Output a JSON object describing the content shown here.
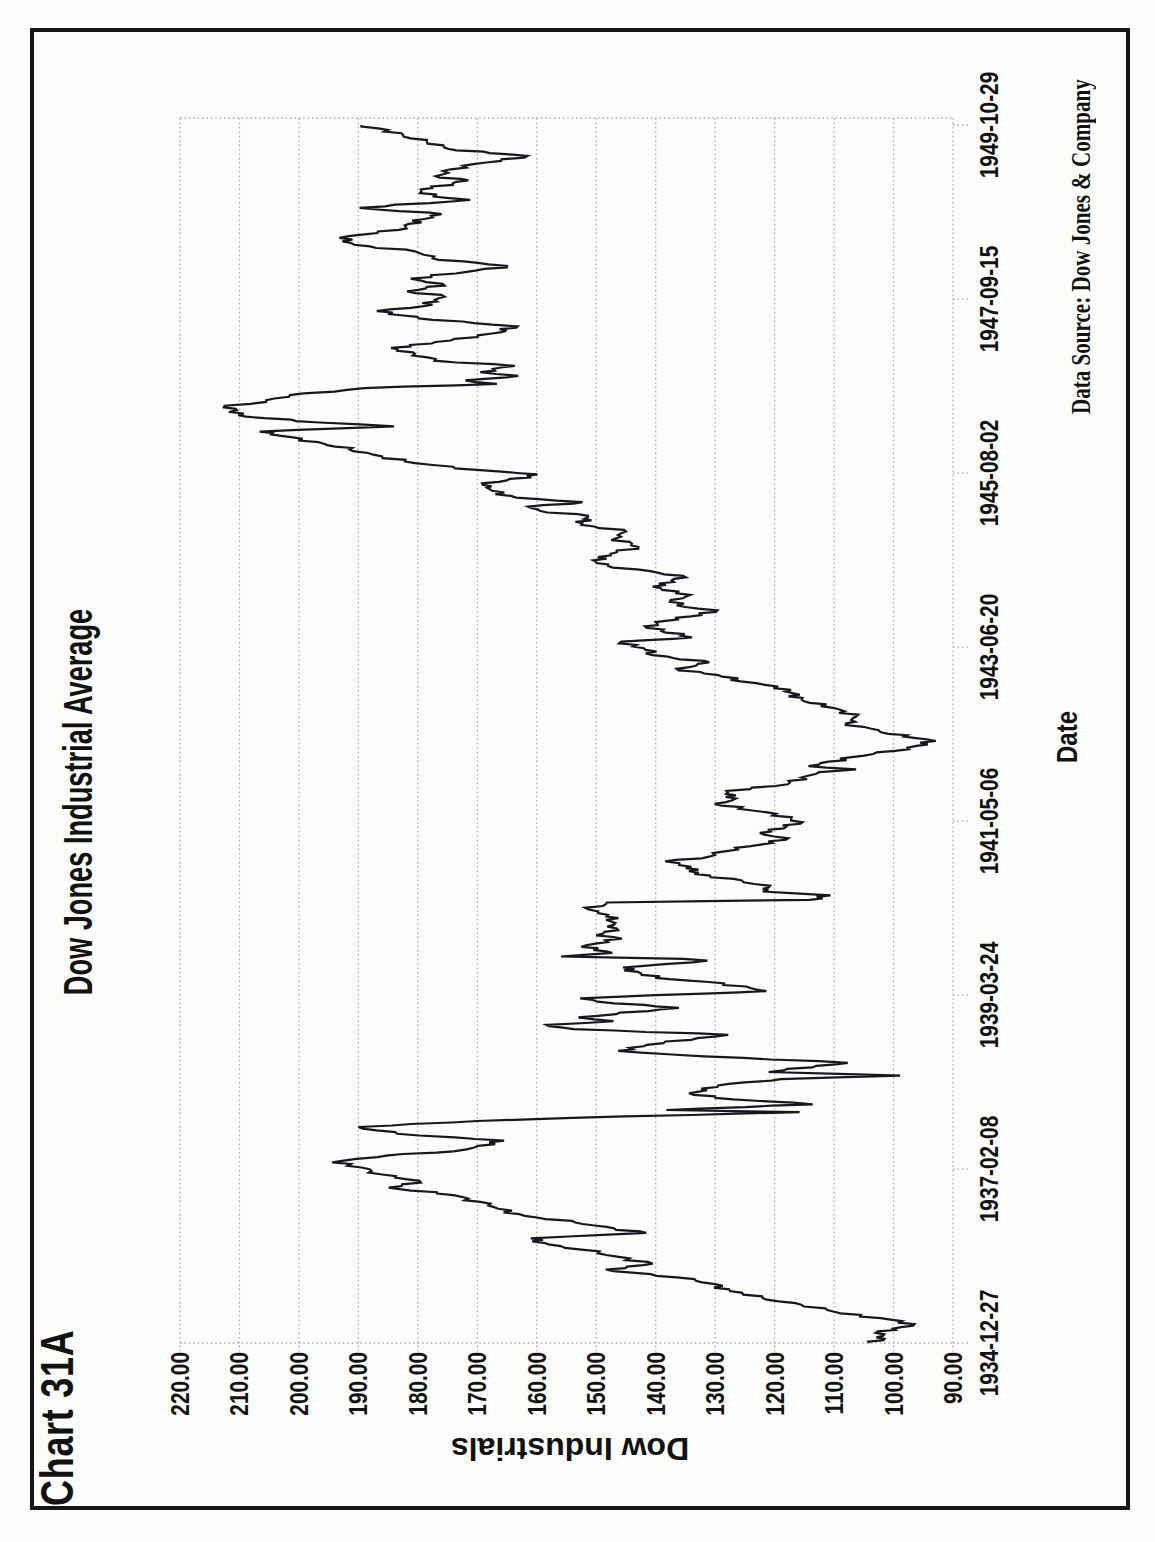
{
  "page": {
    "heading": "Chart 31A"
  },
  "chart_data": {
    "type": "line",
    "title": "Dow Jones Industrial Average",
    "xlabel": "Date",
    "ylabel": "Dow Industrials",
    "source_note": "Data Source:  Dow Jones & Company",
    "ylim": [
      90,
      220
    ],
    "ytick_step": 10,
    "grid": "horizontal dotted gridlines at each 10-point level",
    "legend": "none",
    "xticks": [
      "1934-12-27",
      "1937-02-08",
      "1939-03-24",
      "1941-05-06",
      "1943-06-20",
      "1945-08-02",
      "1947-09-15",
      "1949-10-29"
    ],
    "series": [
      {
        "name": "Dow Jones Industrial Average (weekly close)",
        "points": [
          [
            "1934-12-27",
            104.0
          ],
          [
            "1935-01-15",
            101.5
          ],
          [
            "1935-02-10",
            103.0
          ],
          [
            "1935-03-14",
            96.7
          ],
          [
            "1935-04-10",
            100.5
          ],
          [
            "1935-05-15",
            110.0
          ],
          [
            "1935-06-15",
            115.5
          ],
          [
            "1935-07-15",
            122.0
          ],
          [
            "1935-08-15",
            127.5
          ],
          [
            "1935-09-15",
            130.0
          ],
          [
            "1935-10-15",
            136.5
          ],
          [
            "1935-11-19",
            148.4
          ],
          [
            "1935-12-15",
            140.5
          ],
          [
            "1936-01-15",
            146.5
          ],
          [
            "1936-02-15",
            152.5
          ],
          [
            "1936-03-10",
            158.0
          ],
          [
            "1936-04-06",
            161.0
          ],
          [
            "1936-04-30",
            141.6
          ],
          [
            "1936-05-20",
            147.0
          ],
          [
            "1936-06-15",
            153.5
          ],
          [
            "1936-07-15",
            162.0
          ],
          [
            "1936-08-15",
            166.5
          ],
          [
            "1936-09-15",
            169.5
          ],
          [
            "1936-10-15",
            174.0
          ],
          [
            "1936-11-17",
            184.9
          ],
          [
            "1936-12-10",
            179.5
          ],
          [
            "1937-01-15",
            186.0
          ],
          [
            "1937-02-15",
            189.5
          ],
          [
            "1937-03-10",
            194.4
          ],
          [
            "1937-04-10",
            185.0
          ],
          [
            "1937-04-28",
            174.0
          ],
          [
            "1937-05-15",
            170.5
          ],
          [
            "1937-06-14",
            165.5
          ],
          [
            "1937-07-15",
            183.5
          ],
          [
            "1937-08-14",
            190.0
          ],
          [
            "1937-09-10",
            170.0
          ],
          [
            "1937-09-24",
            154.0
          ],
          [
            "1937-10-19",
            115.8
          ],
          [
            "1937-10-29",
            138.2
          ],
          [
            "1937-11-23",
            113.6
          ],
          [
            "1937-12-15",
            127.0
          ],
          [
            "1938-01-11",
            134.4
          ],
          [
            "1938-02-15",
            129.5
          ],
          [
            "1938-03-15",
            119.0
          ],
          [
            "1938-03-31",
            98.9
          ],
          [
            "1938-04-16",
            121.0
          ],
          [
            "1938-05-27",
            107.7
          ],
          [
            "1938-06-25",
            131.9
          ],
          [
            "1938-07-19",
            146.3
          ],
          [
            "1938-08-15",
            141.5
          ],
          [
            "1938-09-28",
            127.8
          ],
          [
            "1938-10-24",
            153.8
          ],
          [
            "1938-11-12",
            158.4
          ],
          [
            "1938-11-28",
            147.1
          ],
          [
            "1938-12-15",
            153.0
          ],
          [
            "1939-01-26",
            136.1
          ],
          [
            "1939-02-15",
            147.0
          ],
          [
            "1939-03-10",
            152.7
          ],
          [
            "1939-03-31",
            131.8
          ],
          [
            "1939-04-11",
            121.4
          ],
          [
            "1939-05-15",
            128.5
          ],
          [
            "1939-06-09",
            140.1
          ],
          [
            "1939-07-25",
            145.5
          ],
          [
            "1939-08-24",
            131.3
          ],
          [
            "1939-09-01",
            135.3
          ],
          [
            "1939-09-12",
            155.9
          ],
          [
            "1939-09-28",
            147.3
          ],
          [
            "1939-10-25",
            152.5
          ],
          [
            "1939-11-30",
            145.7
          ],
          [
            "1939-12-15",
            150.0
          ],
          [
            "1940-01-15",
            146.5
          ],
          [
            "1940-02-15",
            147.5
          ],
          [
            "1940-03-15",
            148.0
          ],
          [
            "1940-04-08",
            151.3
          ],
          [
            "1940-05-09",
            148.2
          ],
          [
            "1940-05-21",
            114.1
          ],
          [
            "1940-06-10",
            110.6
          ],
          [
            "1940-06-27",
            122.0
          ],
          [
            "1940-07-15",
            121.0
          ],
          [
            "1940-08-15",
            125.5
          ],
          [
            "1940-09-13",
            133.5
          ],
          [
            "1940-10-15",
            134.0
          ],
          [
            "1940-11-08",
            138.4
          ],
          [
            "1940-11-29",
            131.0
          ],
          [
            "1940-12-23",
            128.4
          ],
          [
            "1941-01-15",
            124.0
          ],
          [
            "1941-02-19",
            117.7
          ],
          [
            "1941-03-15",
            122.5
          ],
          [
            "1941-05-01",
            115.3
          ],
          [
            "1941-06-15",
            121.5
          ],
          [
            "1941-07-22",
            130.1
          ],
          [
            "1941-08-15",
            126.5
          ],
          [
            "1941-09-18",
            128.1
          ],
          [
            "1941-10-17",
            117.8
          ],
          [
            "1941-11-24",
            114.4
          ],
          [
            "1941-12-10",
            112.5
          ],
          [
            "1941-12-23",
            106.3
          ],
          [
            "1942-01-06",
            114.3
          ],
          [
            "1942-02-15",
            107.0
          ],
          [
            "1942-03-15",
            99.7
          ],
          [
            "1942-04-28",
            92.9
          ],
          [
            "1942-05-30",
            100.9
          ],
          [
            "1942-06-15",
            102.5
          ],
          [
            "1942-07-15",
            108.0
          ],
          [
            "1942-08-15",
            106.3
          ],
          [
            "1942-09-15",
            109.1
          ],
          [
            "1942-10-15",
            114.1
          ],
          [
            "1942-12-26",
            119.4
          ],
          [
            "1943-01-18",
            125.7
          ],
          [
            "1943-02-15",
            129.5
          ],
          [
            "1943-03-15",
            136.5
          ],
          [
            "1943-04-13",
            131.0
          ],
          [
            "1943-05-15",
            140.5
          ],
          [
            "1943-06-15",
            142.0
          ],
          [
            "1943-07-14",
            145.8
          ],
          [
            "1943-08-02",
            133.9
          ],
          [
            "1943-09-20",
            141.8
          ],
          [
            "1943-10-15",
            138.0
          ],
          [
            "1943-11-30",
            129.6
          ],
          [
            "1943-12-15",
            135.0
          ],
          [
            "1944-01-15",
            137.5
          ],
          [
            "1944-02-07",
            134.2
          ],
          [
            "1944-03-15",
            140.5
          ],
          [
            "1944-04-25",
            134.9
          ],
          [
            "1944-05-15",
            139.5
          ],
          [
            "1944-06-15",
            148.0
          ],
          [
            "1944-07-10",
            150.5
          ],
          [
            "1944-08-15",
            146.5
          ],
          [
            "1944-09-07",
            142.9
          ],
          [
            "1944-10-15",
            146.8
          ],
          [
            "1944-11-15",
            145.0
          ],
          [
            "1944-12-15",
            152.5
          ],
          [
            "1945-01-24",
            151.4
          ],
          [
            "1945-02-15",
            159.5
          ],
          [
            "1945-03-06",
            161.5
          ],
          [
            "1945-03-26",
            152.3
          ],
          [
            "1945-04-15",
            163.5
          ],
          [
            "1945-05-15",
            167.5
          ],
          [
            "1945-06-11",
            169.1
          ],
          [
            "1945-07-27",
            159.9
          ],
          [
            "1945-08-15",
            169.5
          ],
          [
            "1945-09-15",
            180.5
          ],
          [
            "1945-10-15",
            186.0
          ],
          [
            "1945-11-15",
            191.5
          ],
          [
            "1945-12-11",
            195.8
          ],
          [
            "1946-01-15",
            203.0
          ],
          [
            "1946-02-02",
            206.6
          ],
          [
            "1946-02-26",
            184.0
          ],
          [
            "1946-03-15",
            196.5
          ],
          [
            "1946-04-10",
            208.9
          ],
          [
            "1946-05-29",
            212.5
          ],
          [
            "1946-06-15",
            205.5
          ],
          [
            "1946-07-15",
            201.5
          ],
          [
            "1946-08-15",
            189.0
          ],
          [
            "1946-09-03",
            166.7
          ],
          [
            "1946-09-19",
            172.0
          ],
          [
            "1946-10-09",
            163.1
          ],
          [
            "1946-10-25",
            169.5
          ],
          [
            "1946-11-22",
            163.7
          ],
          [
            "1946-12-15",
            177.2
          ],
          [
            "1947-01-15",
            180.5
          ],
          [
            "1947-02-10",
            184.5
          ],
          [
            "1947-03-15",
            174.5
          ],
          [
            "1947-04-15",
            167.5
          ],
          [
            "1947-05-17",
            163.2
          ],
          [
            "1947-06-15",
            177.5
          ],
          [
            "1947-07-24",
            186.9
          ],
          [
            "1947-08-15",
            179.0
          ],
          [
            "1947-09-26",
            175.5
          ],
          [
            "1947-10-20",
            181.8
          ],
          [
            "1947-11-15",
            175.5
          ],
          [
            "1947-12-15",
            181.2
          ],
          [
            "1948-01-15",
            171.5
          ],
          [
            "1948-02-10",
            165.0
          ],
          [
            "1948-03-15",
            177.5
          ],
          [
            "1948-04-15",
            180.5
          ],
          [
            "1948-05-14",
            190.7
          ],
          [
            "1948-06-14",
            193.2
          ],
          [
            "1948-07-19",
            183.2
          ],
          [
            "1948-08-15",
            181.5
          ],
          [
            "1948-09-27",
            176.0
          ],
          [
            "1948-10-25",
            189.8
          ],
          [
            "1948-11-30",
            171.2
          ],
          [
            "1948-12-15",
            177.5
          ],
          [
            "1949-01-15",
            179.5
          ],
          [
            "1949-02-25",
            171.5
          ],
          [
            "1949-03-15",
            177.0
          ],
          [
            "1949-04-15",
            174.5
          ],
          [
            "1949-05-15",
            168.5
          ],
          [
            "1949-06-13",
            161.6
          ],
          [
            "1949-07-15",
            175.0
          ],
          [
            "1949-08-15",
            178.5
          ],
          [
            "1949-09-15",
            182.5
          ],
          [
            "1949-10-29",
            189.5
          ]
        ]
      }
    ],
    "annotations": {
      "sell_arrows_dark_pointing_down": [
        [
          "1937-02-20",
          201.0
        ],
        [
          "1938-11-20",
          161.5
        ],
        [
          "1940-10-30",
          142.0
        ],
        [
          "1943-07-10",
          151.5
        ],
        [
          "1946-01-10",
          211.5
        ],
        [
          "1948-06-15",
          197.5
        ]
      ],
      "buy_arrows_gray_pointing_up": [
        [
          "1938-04-10",
          95.2
        ],
        [
          "1940-06-05",
          108.2
        ],
        [
          "1942-04-25",
          88.5
        ],
        [
          "1944-05-10",
          132.2
        ],
        [
          "1946-10-10",
          158.6
        ],
        [
          "1949-06-15",
          159.0
        ]
      ]
    },
    "colors": {
      "line": "#17171f",
      "sell_arrow_fill": "#43434c",
      "buy_arrow_fill": "#a9a9a9",
      "arrow_outline": "#0a0a0a",
      "gridline": "#adadad",
      "text": "#121212",
      "frame": "#161616",
      "background": "#fcfcfb"
    },
    "layout_note": "landscape chart printed rotated 90° counter-clockwise on a portrait scanned book page"
  }
}
